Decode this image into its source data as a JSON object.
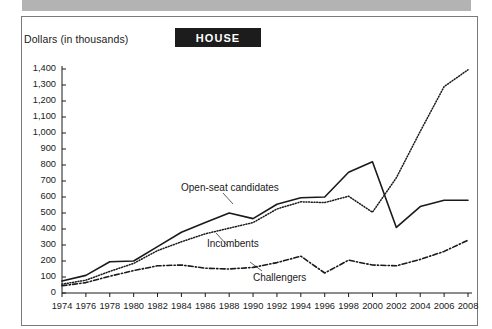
{
  "banner": {
    "label": "HOUSE"
  },
  "axis_title": "Dollars (in thousands)",
  "series_labels": {
    "open_seat": "Open-seat candidates",
    "incumbents": "Incumbents",
    "challengers": "Challengers"
  },
  "colors": {
    "ink": "#1a1a1a",
    "banner_bg": "#1c1c1c",
    "banner_text": "#ffffff",
    "frame": "#7a7a7a",
    "topbar": "#b3b3b3"
  },
  "chart_data": {
    "type": "line",
    "title": "HOUSE",
    "xlabel": "",
    "ylabel": "Dollars (in thousands)",
    "ylim": [
      0,
      1400
    ],
    "ytick_step": 100,
    "yticks": [
      0,
      100,
      200,
      300,
      400,
      500,
      600,
      700,
      800,
      900,
      1000,
      1100,
      1200,
      1300,
      1400
    ],
    "ytick_labels": [
      "0",
      "100",
      "200",
      "300",
      "400",
      "500",
      "600",
      "700",
      "800",
      "900",
      "1,000",
      "1,100",
      "1,200",
      "1,300",
      "1,400"
    ],
    "grid": false,
    "legend": "inline-annotations",
    "categories": [
      1974,
      1976,
      1978,
      1980,
      1982,
      1984,
      1986,
      1988,
      1990,
      1992,
      1994,
      1996,
      1998,
      2000,
      2002,
      2004,
      2006,
      2008
    ],
    "xtick_labels": [
      "1974",
      "1976",
      "1978",
      "1980",
      "1982",
      "1984",
      "1986",
      "1988",
      "1990",
      "1992",
      "1994",
      "1996",
      "1998",
      "2000",
      "2002",
      "2004",
      "2006",
      "2008"
    ],
    "series": [
      {
        "name": "Open-seat candidates",
        "style": "solid",
        "values": [
          75,
          110,
          195,
          200,
          290,
          380,
          440,
          500,
          465,
          555,
          595,
          600,
          755,
          820,
          410,
          540,
          580,
          580
        ]
      },
      {
        "name": "Incumbents",
        "style": "dotted",
        "values": [
          55,
          80,
          135,
          185,
          265,
          320,
          370,
          405,
          440,
          525,
          570,
          565,
          605,
          505,
          720,
          1010,
          1290,
          1395
        ]
      },
      {
        "name": "Challengers",
        "style": "dash-dot",
        "values": [
          45,
          65,
          105,
          140,
          170,
          175,
          155,
          150,
          160,
          190,
          230,
          125,
          205,
          175,
          170,
          210,
          260,
          330
        ]
      }
    ]
  }
}
